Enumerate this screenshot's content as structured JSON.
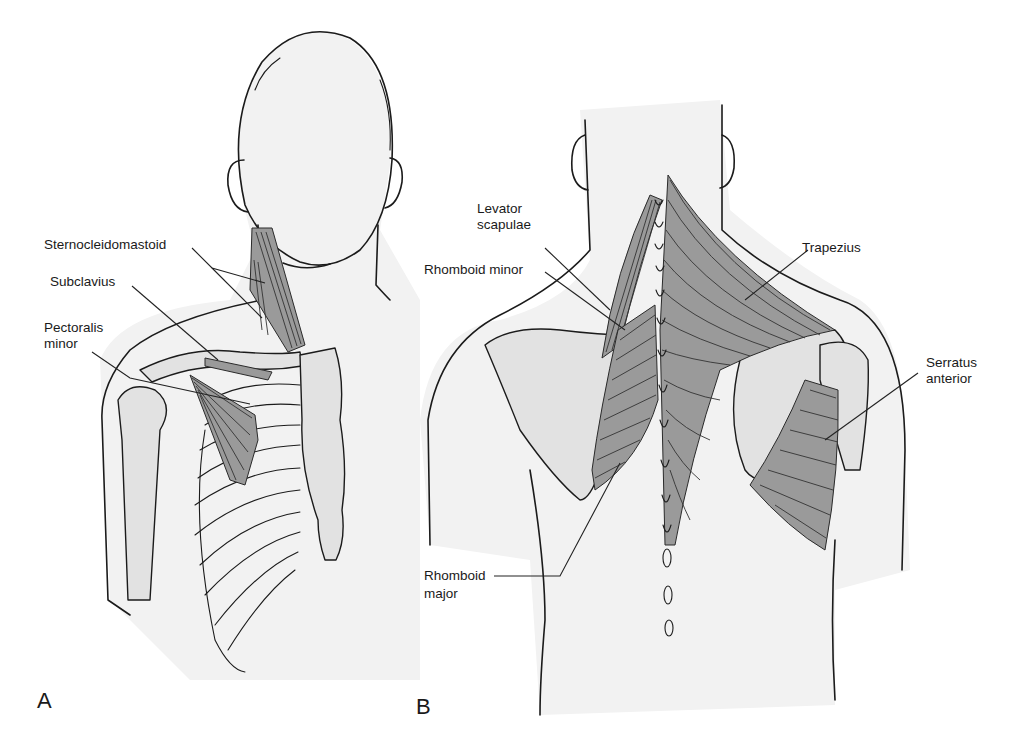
{
  "figure": {
    "colors": {
      "background": "#ffffff",
      "skin": "#f2f2f2",
      "bone": "#e2e2e2",
      "muscle": "#9a9a9a",
      "outline": "#1b1b1b"
    },
    "panel_a": {
      "letter": "A",
      "view": "anterior",
      "labels": {
        "sternocleidomastoid": "Sternocleidomastoid",
        "subclavius": "Subclavius",
        "pectoralis_minor_1": "Pectoralis",
        "pectoralis_minor_2": "minor"
      }
    },
    "panel_b": {
      "letter": "B",
      "view": "posterior",
      "labels": {
        "levator_scapulae_1": "Levator",
        "levator_scapulae_2": "scapulae",
        "rhomboid_minor": "Rhomboid minor",
        "trapezius": "Trapezius",
        "serratus_anterior_1": "Serratus",
        "serratus_anterior_2": "anterior",
        "rhomboid_major_1": "Rhomboid",
        "rhomboid_major_2": "major"
      }
    }
  }
}
